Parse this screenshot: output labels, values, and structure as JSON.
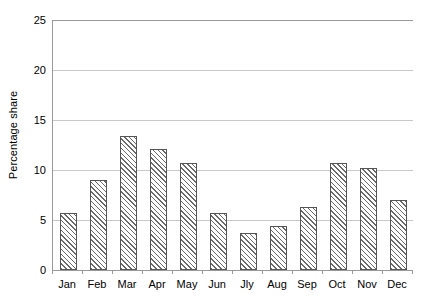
{
  "chart_data": {
    "type": "bar",
    "title": "",
    "subtitle": "",
    "xlabel": "",
    "ylabel": "Percentage share",
    "categories": [
      "Jan",
      "Feb",
      "Mar",
      "Apr",
      "May",
      "Jun",
      "Jly",
      "Aug",
      "Sep",
      "Oct",
      "Nov",
      "Dec"
    ],
    "values": [
      5.7,
      9.0,
      13.4,
      12.1,
      10.7,
      5.7,
      3.7,
      4.4,
      6.3,
      10.7,
      10.2,
      7.0
    ],
    "ylim": [
      0,
      25
    ],
    "ytick_values": [
      0,
      5,
      10,
      15,
      20,
      25
    ],
    "ytick_labels": [
      "0",
      "5",
      "10",
      "15",
      "20",
      "25"
    ],
    "grid": true,
    "grid_axis": "y",
    "legend": false,
    "legend_position": "none",
    "series": [
      {
        "name": "Percentage share",
        "values": [
          5.7,
          9.0,
          13.4,
          12.1,
          10.7,
          5.7,
          3.7,
          4.4,
          6.3,
          10.7,
          10.2,
          7.0
        ]
      }
    ],
    "annotations": []
  },
  "style": {
    "background_color": "#ffffff",
    "bar_fill_color": "#ffffff",
    "bar_hatch_color": "#6a6a6a",
    "bar_border_color": "#555555",
    "gridline_color": "#c8c8c8",
    "axis_color": "#9a9a9a",
    "text_color": "#000000"
  }
}
